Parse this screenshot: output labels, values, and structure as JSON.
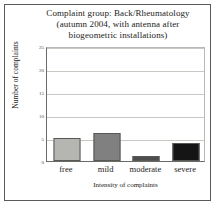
{
  "chart_data": {
    "type": "bar",
    "title": "Complaint group: Back/Rheumatology (autumn 2004, with antenna after biogeometric installations)",
    "title_lines": [
      "Complaint group: Back/Rheumatology",
      "(autumn 2004, with antenna after",
      "biogeometric installations)"
    ],
    "categories": [
      "free",
      "mild",
      "moderate",
      "severe"
    ],
    "values": [
      5,
      6,
      1,
      4
    ],
    "bar_colors": [
      "#b5b5b2",
      "#808080",
      "#4d4d4d",
      "#151515"
    ],
    "xlabel": "Intensity of complaints",
    "ylabel": "Number of complaints",
    "ylim": [
      0,
      25
    ],
    "yticks": [
      0,
      5,
      10,
      15,
      20,
      25
    ],
    "ytick_labels": [
      "0",
      "5",
      "10",
      "15",
      "20",
      "25"
    ],
    "grid": true,
    "legend": "none"
  }
}
